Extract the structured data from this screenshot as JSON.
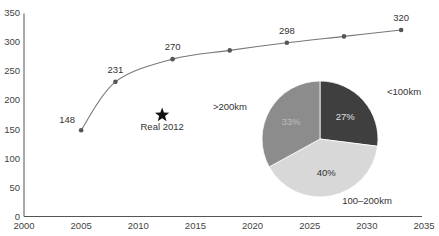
{
  "chart_data": [
    {
      "type": "line",
      "title": "",
      "xlabel": "",
      "ylabel": "",
      "xlim": [
        2000,
        2035
      ],
      "ylim": [
        0,
        350
      ],
      "grid": false,
      "x_ticks": [
        2000,
        2005,
        2010,
        2015,
        2020,
        2025,
        2030,
        2035
      ],
      "y_ticks": [
        0,
        50,
        100,
        150,
        200,
        250,
        300,
        350
      ],
      "series": [
        {
          "name": "projection",
          "x": [
            2005,
            2008,
            2013,
            2018,
            2023,
            2028,
            2033
          ],
          "values": [
            148,
            231,
            270,
            285,
            298,
            309,
            320
          ],
          "labels": [
            "148",
            "231",
            "270",
            "",
            "298",
            "",
            "320"
          ]
        }
      ],
      "annotations": [
        {
          "type": "star",
          "x": 2012,
          "y": 174,
          "text": "Real 2012"
        }
      ]
    },
    {
      "type": "pie",
      "categories": [
        "<100km",
        "100–200km",
        ">200km"
      ],
      "values": [
        27,
        40,
        33
      ],
      "value_labels": [
        "27%",
        "40%",
        "33%"
      ],
      "colors": [
        "#3f3f3f",
        "#d8d8d8",
        "#8c8c8c"
      ],
      "label_colors": [
        "#e0e0e0",
        "#333333",
        "#bdbdbd"
      ]
    }
  ]
}
